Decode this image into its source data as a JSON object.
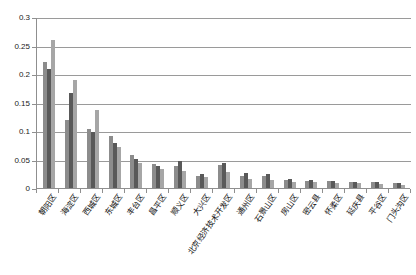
{
  "chart_data": {
    "type": "bar",
    "title": "",
    "subtitle": "",
    "xlabel": "",
    "ylabel": "",
    "ylim": [
      0,
      0.3
    ],
    "ytick_labels": [
      "0",
      "0.05",
      "0.1",
      "0.15",
      "0.2",
      "0.25",
      "0.3"
    ],
    "ytick_values": [
      0,
      0.05,
      0.1,
      0.15,
      0.2,
      0.25,
      0.3
    ],
    "grid": true,
    "legend": "none",
    "legend_entries": [],
    "categories": [
      "朝阳区",
      "海淀区",
      "西城区",
      "东城区",
      "丰台区",
      "昌平区",
      "顺义区",
      "大兴区",
      "北京经济技术开发区",
      "通州区",
      "石景山区",
      "房山区",
      "密云县",
      "怀柔区",
      "延庆县",
      "平谷区",
      "门头沟区"
    ],
    "series": [
      {
        "name": "series-1",
        "color": "#8c8c8c",
        "values": [
          0.222,
          0.12,
          0.105,
          0.092,
          0.058,
          0.042,
          0.038,
          0.022,
          0.04,
          0.022,
          0.022,
          0.015,
          0.013,
          0.012,
          0.01,
          0.01,
          0.008
        ]
      },
      {
        "name": "series-2",
        "color": "#595959",
        "values": [
          0.21,
          0.168,
          0.098,
          0.08,
          0.052,
          0.038,
          0.048,
          0.024,
          0.044,
          0.026,
          0.024,
          0.016,
          0.014,
          0.013,
          0.011,
          0.011,
          0.009
        ]
      },
      {
        "name": "series-3",
        "color": "#a6a6a6",
        "values": [
          0.261,
          0.19,
          0.138,
          0.072,
          0.045,
          0.034,
          0.03,
          0.02,
          0.028,
          0.016,
          0.014,
          0.011,
          0.01,
          0.009,
          0.008,
          0.007,
          0.005
        ]
      }
    ]
  }
}
